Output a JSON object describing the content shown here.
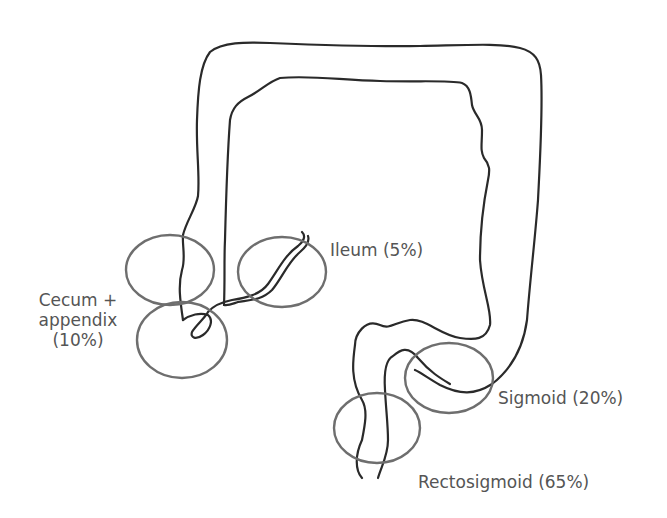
{
  "diagram": {
    "type": "anatomical-outline",
    "stroke_color": "#2a2a2a",
    "circle_color": "#6e6e6e",
    "text_color": "#555555",
    "sites": [
      {
        "id": "ileum",
        "label": "Ileum (5%)",
        "percent": 5
      },
      {
        "id": "cecum-appendix",
        "label_line1": "Cecum +",
        "label_line2": "appendix",
        "label_line3": "(10%)",
        "percent": 10
      },
      {
        "id": "sigmoid",
        "label": "Sigmoid (20%)",
        "percent": 20
      },
      {
        "id": "rectosigmoid",
        "label": "Rectosigmoid (65%)",
        "percent": 65
      }
    ]
  }
}
